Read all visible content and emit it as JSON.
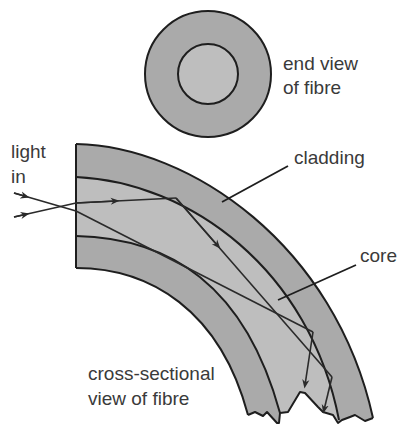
{
  "figure": {
    "colors": {
      "cladding": "#aaaaaa",
      "core": "#bebebe",
      "outline": "#1e1e1e",
      "text": "#3a3a3a",
      "background": "#ffffff"
    },
    "labels": {
      "end_view_line1": "end view",
      "end_view_line2": "of fibre",
      "light_in_line1": "light",
      "light_in_line2": "in",
      "cladding": "cladding",
      "core": "core",
      "cross_section_line1": "cross-sectional",
      "cross_section_line2": "view of fibre"
    }
  }
}
